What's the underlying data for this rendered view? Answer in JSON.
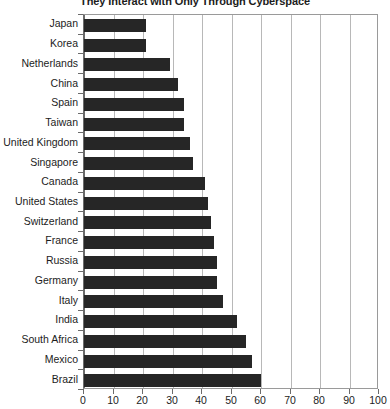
{
  "chart_data": {
    "type": "bar",
    "orientation": "horizontal",
    "title": "They Interact with Only Through Cyberspace",
    "xlabel": "",
    "ylabel": "",
    "xlim": [
      0,
      100
    ],
    "xticks": [
      0,
      10,
      20,
      30,
      40,
      50,
      60,
      70,
      80,
      90,
      100
    ],
    "grid": true,
    "legend": null,
    "bar_color": "#262626",
    "categories": [
      "Japan",
      "Korea",
      "Netherlands",
      "China",
      "Spain",
      "Taiwan",
      "United Kingdom",
      "Singapore",
      "Canada",
      "United States",
      "Switzerland",
      "France",
      "Russia",
      "Germany",
      "Italy",
      "India",
      "South Africa",
      "Mexico",
      "Brazil"
    ],
    "values": [
      21,
      21,
      29,
      32,
      34,
      34,
      36,
      37,
      41,
      42,
      43,
      44,
      45,
      45,
      47,
      52,
      55,
      57,
      60
    ]
  }
}
